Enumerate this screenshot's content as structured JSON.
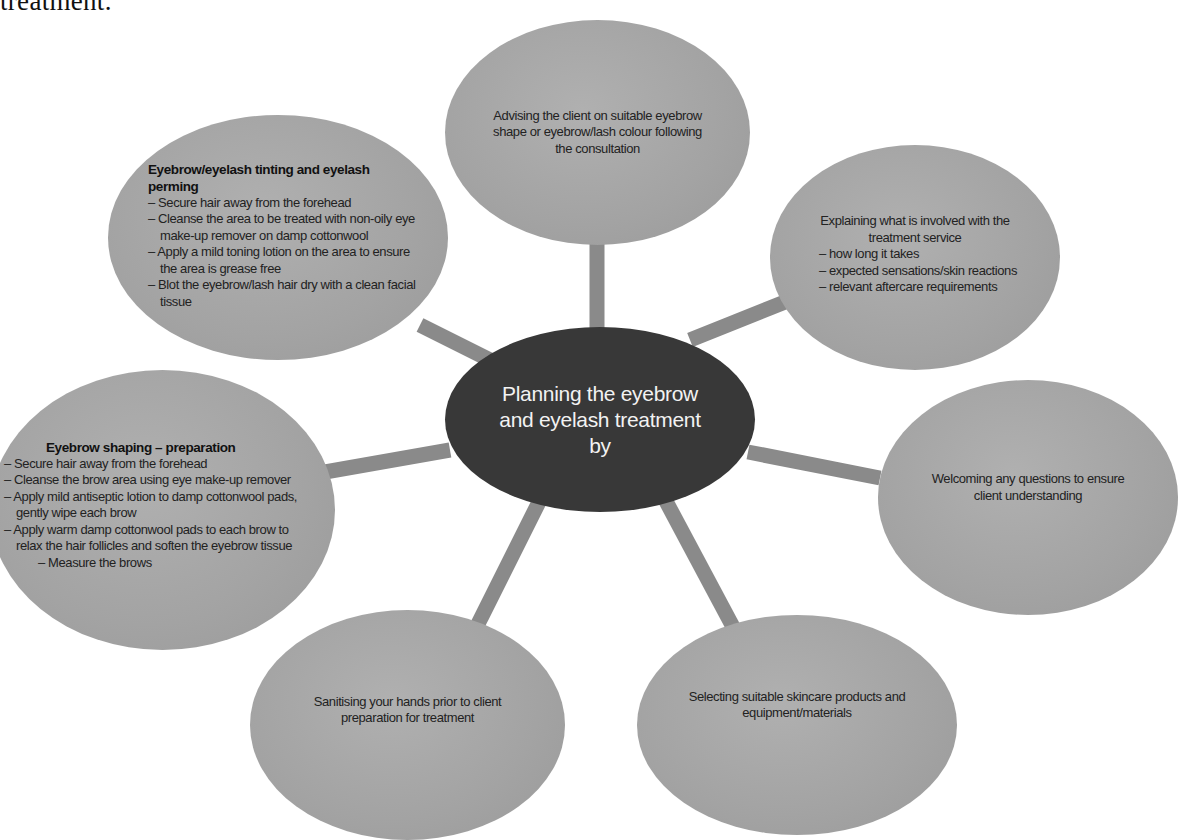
{
  "caption_fragment": "treatment.",
  "colors": {
    "center_fill": "#383838",
    "node_fill": "#a6a6a6",
    "connector": "#888888",
    "center_text": "#f2f2f2",
    "node_text": "#222222"
  },
  "center": {
    "label": "Planning the eyebrow and eyelash treatment by",
    "lines": [
      "Planning the eyebrow",
      "and eyelash treatment",
      "by"
    ]
  },
  "nodes": {
    "advising": {
      "lines": [
        "Advising the client on suitable eyebrow",
        "shape or eyebrow/lash colour following",
        "the consultation"
      ]
    },
    "explaining": {
      "lines": [
        "Explaining what is involved with the",
        "treatment service"
      ],
      "bullets": [
        "– how long it takes",
        "– expected sensations/skin reactions",
        "– relevant aftercare requirements"
      ]
    },
    "welcoming": {
      "lines": [
        "Welcoming any questions to ensure",
        "client understanding"
      ]
    },
    "selecting": {
      "lines": [
        "Selecting suitable skincare products and",
        "equipment/materials"
      ]
    },
    "sanitising": {
      "lines": [
        "Sanitising your hands prior to client",
        "preparation for treatment"
      ]
    },
    "shaping": {
      "heading": "Eyebrow shaping – preparation",
      "bullets": [
        "– Secure hair away from the forehead",
        "– Cleanse the brow area using eye make-up remover",
        "– Apply mild antiseptic lotion to damp cottonwool pads, gently wipe each brow",
        "– Apply warm damp cottonwool pads to each brow to relax the hair follicles and soften the eyebrow tissue"
      ],
      "last": "– Measure the brows"
    },
    "tinting": {
      "heading": "Eyebrow/eyelash tinting and eyelash perming",
      "bullets": [
        "– Secure hair away from the forehead",
        "– Cleanse the area to be treated with non-oily eye make-up remover on damp cottonwool",
        "– Apply a mild toning lotion on the area to ensure the area is grease free",
        "– Blot the eyebrow/lash hair dry with a clean facial tissue"
      ]
    }
  }
}
